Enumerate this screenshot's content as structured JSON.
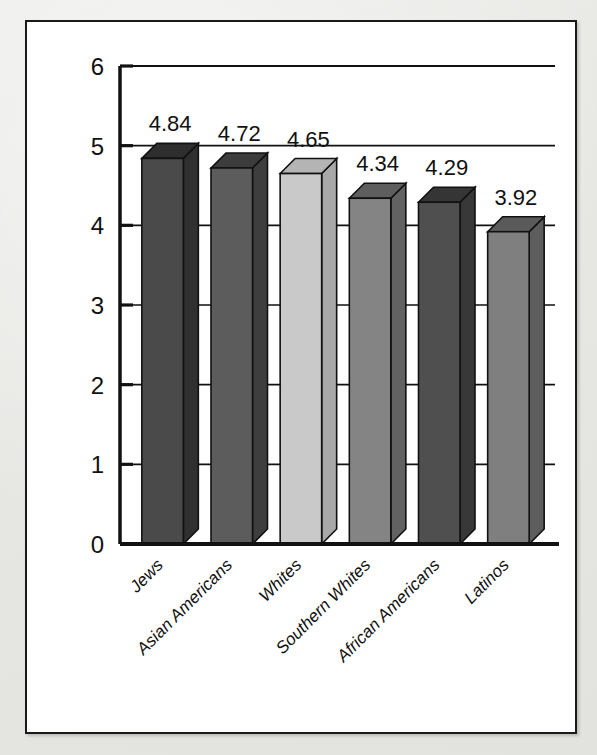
{
  "figure": {
    "background_color": "#e9e9e7",
    "panel_color": "#ffffff",
    "border_color": "#1a1a1a"
  },
  "chart_data": {
    "type": "bar",
    "title": "",
    "subtitle": "",
    "xlabel": "",
    "ylabel": "",
    "categories": [
      "Jews",
      "Asian Americans",
      "Whites",
      "Southern Whites",
      "African Americans",
      "Latinos"
    ],
    "values": [
      4.84,
      4.72,
      4.65,
      4.34,
      4.29,
      3.92
    ],
    "value_labels": [
      "4.84",
      "4.72",
      "4.65",
      "4.34",
      "4.29",
      "3.92"
    ],
    "ylim": [
      0,
      6
    ],
    "ytick_labels": [
      "0",
      "1",
      "2",
      "3",
      "4",
      "5",
      "6"
    ],
    "ytick_values": [
      0,
      1,
      2,
      3,
      4,
      5,
      6
    ],
    "grid": true,
    "grid_axis": "y",
    "legend": "none",
    "style": "3d-bars",
    "bar_colors": [
      "#4a4a4a",
      "#5c5c5c",
      "#c9c9c9",
      "#848484",
      "#4f4f4f",
      "#7f7f7f"
    ],
    "bar_top_colors": [
      "#2e2e2e",
      "#3c3c3c",
      "#b4b4b4",
      "#5e5e5e",
      "#353535",
      "#5a5a5a"
    ],
    "bar_side_colors": [
      "#303030",
      "#3e3e3e",
      "#a8a8a8",
      "#626262",
      "#383838",
      "#5d5d5d"
    ],
    "label_rotation_deg": -45
  }
}
